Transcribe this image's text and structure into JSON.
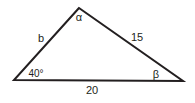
{
  "diagram": {
    "type": "triangle",
    "stroke_color": "#231f20",
    "vertices": {
      "top": [
        79,
        8
      ],
      "left": [
        14,
        80
      ],
      "right": [
        183,
        81
      ]
    },
    "labels": {
      "angle_top": "α",
      "side_left": "b",
      "side_right": "15",
      "angle_left": "40°",
      "angle_right": "β",
      "side_bottom": "20"
    }
  }
}
